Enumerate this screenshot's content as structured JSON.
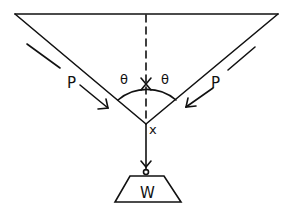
{
  "diagram": {
    "labels": {
      "theta_left": "θ",
      "theta_right": "θ",
      "force_left": "P",
      "force_right": "P",
      "junction": "x",
      "weight": "W"
    },
    "colors": {
      "stroke": "#111111",
      "background": "#ffffff"
    }
  }
}
